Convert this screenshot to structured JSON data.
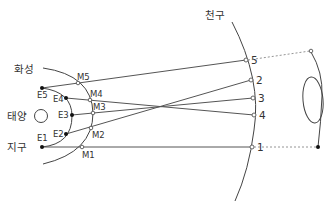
{
  "labels": {
    "celestial_sphere": "천구",
    "mars": "화성",
    "sun": "태양",
    "earth": "지구"
  },
  "earth_points": [
    {
      "id": "E1",
      "label": "E1"
    },
    {
      "id": "E2",
      "label": "E2"
    },
    {
      "id": "E3",
      "label": "E3"
    },
    {
      "id": "E4",
      "label": "E4"
    },
    {
      "id": "E5",
      "label": "E5"
    }
  ],
  "mars_points": [
    {
      "id": "M1",
      "label": "M1"
    },
    {
      "id": "M2",
      "label": "M2"
    },
    {
      "id": "M3",
      "label": "M3"
    },
    {
      "id": "M4",
      "label": "M4"
    },
    {
      "id": "M5",
      "label": "M5"
    }
  ],
  "sky_positions": [
    {
      "id": "1",
      "label": "1"
    },
    {
      "id": "2",
      "label": "2"
    },
    {
      "id": "3",
      "label": "3"
    },
    {
      "id": "4",
      "label": "4"
    },
    {
      "id": "5",
      "label": "5"
    }
  ],
  "sight_lines": [
    {
      "from": "E1",
      "via": "M1",
      "to": "1"
    },
    {
      "from": "E2",
      "via": "M2",
      "to": "2"
    },
    {
      "from": "E3",
      "via": "M3",
      "to": "3"
    },
    {
      "from": "E4",
      "via": "M4",
      "to": "4"
    },
    {
      "from": "E5",
      "via": "M5",
      "to": "5"
    }
  ],
  "colors": {
    "line": "#444444",
    "text": "#333333",
    "dotted": "#888888",
    "background": "#ffffff"
  }
}
